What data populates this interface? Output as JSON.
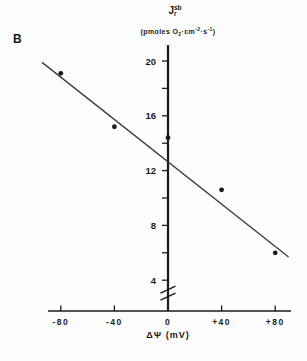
{
  "panel_label": "B",
  "y_axis_title": {
    "symbol": "J",
    "sup": "sb",
    "sub": "r"
  },
  "y_axis_units": {
    "open": "(pmoles O",
    "o2_sub": "2",
    "dot_cm": "·cm",
    "cm_exp": "-2",
    "dot_s": "·s",
    "s_exp": "-1",
    "close": ")"
  },
  "x_axis_title": {
    "delta_psi": "ΔΨ",
    "units": "(mV)"
  },
  "colors": {
    "ink": "#1a1a1a",
    "trend_line": "#3a3a3a",
    "background": "#fdfdfd"
  },
  "chart_data": {
    "type": "scatter",
    "title": "",
    "xlabel": "ΔΨ (mV)",
    "ylabel": "Jr_sb (pmoles O2·cm-2·s-1)",
    "x": [
      -80,
      -40,
      0,
      40,
      80
    ],
    "y": [
      19.1,
      15.2,
      14.4,
      10.6,
      6.0
    ],
    "x_ticks": [
      -80,
      -40,
      0,
      40,
      80
    ],
    "x_tick_labels": [
      "-80",
      "-40",
      "0",
      "+40",
      "+80"
    ],
    "y_ticks_minor": [
      4,
      6,
      8,
      10,
      12,
      14,
      16,
      18,
      20
    ],
    "y_ticks_labeled": [
      4,
      8,
      12,
      16,
      20
    ],
    "y_tick_label_strings": [
      "4",
      "8",
      "12",
      "16",
      "20"
    ],
    "xlim": [
      -91,
      91
    ],
    "ylim_shown": [
      4,
      21.2
    ],
    "y_axis_break_below": 4,
    "grid": false,
    "legend": "none",
    "marker": "filled-circle",
    "trend_line": {
      "x1": -94,
      "y1": 19.9,
      "x2": 90,
      "y2": 5.7
    }
  }
}
